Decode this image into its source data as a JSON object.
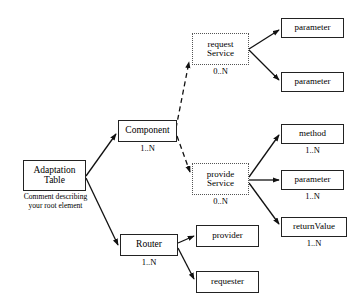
{
  "diagram": {
    "type": "tree-diagram",
    "canvas": {
      "width": 354,
      "height": 308
    },
    "colors": {
      "background": "#ffffff",
      "solid_border": "#222222",
      "dotted_border": "#555555",
      "edge": "#111111",
      "text": "#000000"
    },
    "nodes": [
      {
        "id": "adaptation-table",
        "label": "Adaptation\nTable",
        "line1": "Adaptation",
        "line2": "Table",
        "border": "solid",
        "multiplicity": "",
        "comment": "Comment describing\nyour root element",
        "x": 23,
        "y": 160,
        "w": 63,
        "h": 31,
        "font_size": 9.5
      },
      {
        "id": "component",
        "label": "Component",
        "line1": "Component",
        "line2": "",
        "border": "solid",
        "multiplicity": "1..N",
        "comment": "",
        "x": 118,
        "y": 120,
        "w": 59,
        "h": 22,
        "font_size": 9.5
      },
      {
        "id": "router",
        "label": "Router",
        "line1": "Router",
        "line2": "",
        "border": "solid",
        "multiplicity": "1..N",
        "comment": "",
        "x": 120,
        "y": 234,
        "w": 58,
        "h": 22,
        "font_size": 9.5
      },
      {
        "id": "request-service",
        "label": "request\nService",
        "line1": "request",
        "line2": "Service",
        "border": "dotted",
        "multiplicity": "0..N",
        "comment": "",
        "x": 192,
        "y": 33,
        "w": 57,
        "h": 32,
        "font_size": 9
      },
      {
        "id": "provide-service",
        "label": "provide\nService",
        "line1": "provide",
        "line2": "Service",
        "border": "dotted",
        "multiplicity": "0..N",
        "comment": "",
        "x": 192,
        "y": 163,
        "w": 57,
        "h": 32,
        "font_size": 9
      },
      {
        "id": "parameter-request-1",
        "label": "parameter",
        "line1": "parameter",
        "line2": "",
        "border": "solid",
        "multiplicity": "",
        "comment": "",
        "x": 281,
        "y": 18,
        "w": 63,
        "h": 20,
        "font_size": 9
      },
      {
        "id": "parameter-request-2",
        "label": "parameter",
        "line1": "parameter",
        "line2": "",
        "border": "solid",
        "multiplicity": "",
        "comment": "",
        "x": 281,
        "y": 72,
        "w": 63,
        "h": 20,
        "font_size": 9
      },
      {
        "id": "method",
        "label": "method",
        "line1": "method",
        "line2": "",
        "border": "solid",
        "multiplicity": "1..N",
        "comment": "",
        "x": 281,
        "y": 124,
        "w": 63,
        "h": 20,
        "font_size": 9
      },
      {
        "id": "parameter-provide",
        "label": "parameter",
        "line1": "parameter",
        "line2": "",
        "border": "solid",
        "multiplicity": "1..N",
        "comment": "",
        "x": 281,
        "y": 170,
        "w": 63,
        "h": 20,
        "font_size": 9
      },
      {
        "id": "return-value",
        "label": "returnValue",
        "line1": "returnValue",
        "line2": "",
        "border": "solid",
        "multiplicity": "1..N",
        "comment": "",
        "x": 281,
        "y": 217,
        "w": 66,
        "h": 20,
        "font_size": 9
      },
      {
        "id": "provider",
        "label": "provider",
        "line1": "provider",
        "line2": "",
        "border": "solid",
        "multiplicity": "",
        "comment": "",
        "x": 196,
        "y": 225,
        "w": 63,
        "h": 22,
        "font_size": 9
      },
      {
        "id": "requester",
        "label": "requester",
        "line1": "requester",
        "line2": "",
        "border": "solid",
        "multiplicity": "",
        "comment": "",
        "x": 196,
        "y": 271,
        "w": 63,
        "h": 22,
        "font_size": 9
      }
    ],
    "edges": [
      {
        "id": "edge-adaptation-component",
        "from": "adaptation-table",
        "to": "component",
        "style": "solid",
        "x1": 86,
        "y1": 176,
        "x2": 116,
        "y2": 134
      },
      {
        "id": "edge-adaptation-router",
        "from": "adaptation-table",
        "to": "router",
        "style": "solid",
        "x1": 86,
        "y1": 178,
        "x2": 118,
        "y2": 245
      },
      {
        "id": "edge-component-request-service",
        "from": "component",
        "to": "request-service",
        "style": "dashed",
        "x1": 176,
        "y1": 128,
        "x2": 189,
        "y2": 62
      },
      {
        "id": "edge-component-provide-service",
        "from": "component",
        "to": "provide-service",
        "style": "dashed",
        "x1": 177,
        "y1": 136,
        "x2": 190,
        "y2": 172
      },
      {
        "id": "edge-request-parameter-1",
        "from": "request-service",
        "to": "parameter-request-1",
        "style": "solid",
        "x1": 249,
        "y1": 49,
        "x2": 279,
        "y2": 30
      },
      {
        "id": "edge-request-parameter-2",
        "from": "request-service",
        "to": "parameter-request-2",
        "style": "solid",
        "x1": 249,
        "y1": 50,
        "x2": 279,
        "y2": 80
      },
      {
        "id": "edge-provide-method",
        "from": "provide-service",
        "to": "method",
        "style": "solid",
        "x1": 249,
        "y1": 177,
        "x2": 279,
        "y2": 135
      },
      {
        "id": "edge-provide-parameter",
        "from": "provide-service",
        "to": "parameter-provide",
        "style": "solid",
        "x1": 249,
        "y1": 180,
        "x2": 279,
        "y2": 180
      },
      {
        "id": "edge-provide-return-value",
        "from": "provide-service",
        "to": "return-value",
        "style": "solid",
        "x1": 249,
        "y1": 183,
        "x2": 279,
        "y2": 224
      },
      {
        "id": "edge-router-provider",
        "from": "router",
        "to": "provider",
        "style": "solid",
        "x1": 178,
        "y1": 243,
        "x2": 194,
        "y2": 236
      },
      {
        "id": "edge-router-requester",
        "from": "router",
        "to": "requester",
        "style": "solid",
        "x1": 178,
        "y1": 248,
        "x2": 194,
        "y2": 279
      }
    ]
  }
}
